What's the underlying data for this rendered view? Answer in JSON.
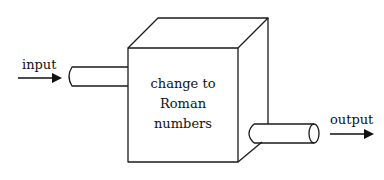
{
  "diagram": {
    "type": "process-box",
    "input_label": "input",
    "output_label": "output",
    "process": {
      "lines": [
        "change to",
        "Roman",
        "numbers"
      ]
    },
    "stroke_color": "#1a1a1a",
    "background": "#ffffff"
  }
}
